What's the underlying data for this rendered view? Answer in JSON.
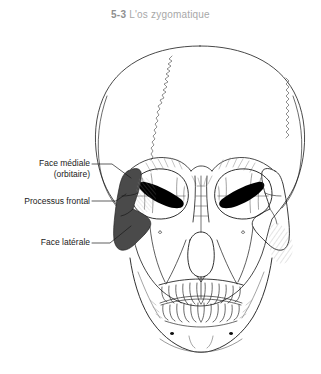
{
  "figure": {
    "number": "5-3",
    "caption": "L'os zygomatique",
    "number_color": "#8f8f8f",
    "caption_color": "#a8a8a8"
  },
  "illustration": {
    "name": "human-skull-anterior-view",
    "background_color": "#ffffff",
    "line_color": "#1a1a1a",
    "highlight_bone": "os zygomatique",
    "highlight_side": "left",
    "highlight_fill": "#4a4a4a",
    "detail_line_color": "#6e6e6e"
  },
  "labels": [
    {
      "id": "face-mediale",
      "line1": "Face médiale",
      "line2": "(orbitaire)",
      "target": "medial (orbital) surface of the zygomatic bone"
    },
    {
      "id": "processus-frontal",
      "line1": "Processus frontal",
      "line2": "",
      "target": "frontal process of the zygomatic bone"
    },
    {
      "id": "face-laterale",
      "line1": "Face latérale",
      "line2": "",
      "target": "lateral surface of the zygomatic bone"
    }
  ]
}
